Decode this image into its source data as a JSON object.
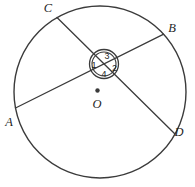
{
  "diagram": {
    "point_labels": {
      "a": "A",
      "b": "B",
      "c": "C",
      "d": "D"
    },
    "center_label": "O",
    "angle_numbers": {
      "n1": "1",
      "n2": "2",
      "n3": "3",
      "n4": "4"
    },
    "colors": {
      "stroke": "#3b3b3b",
      "text": "#1f1f1f",
      "background": "#ffffff"
    }
  }
}
